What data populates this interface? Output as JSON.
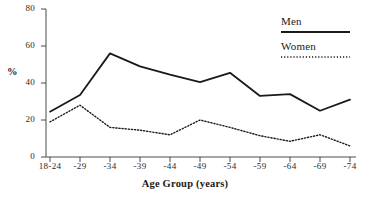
{
  "chart_data": {
    "type": "line",
    "title": "",
    "xlabel": "Age Group (years)",
    "ylabel": "%",
    "categories": [
      "18-24",
      "-29",
      "-34",
      "-39",
      "-44",
      "-49",
      "-54",
      "-59",
      "-64",
      "-69",
      "-74"
    ],
    "series": [
      {
        "name": "Men",
        "style": "solid",
        "color": "#1a1a1a",
        "values": [
          24.5,
          33.5,
          56.0,
          49.0,
          44.5,
          40.5,
          45.5,
          33.0,
          34.0,
          25.0,
          31.0
        ]
      },
      {
        "name": "Women",
        "style": "dotted",
        "color": "#1a1a1a",
        "values": [
          19.0,
          28.0,
          16.0,
          14.5,
          12.0,
          20.0,
          16.0,
          11.5,
          8.5,
          12.0,
          6.0
        ]
      }
    ],
    "ylim": [
      0,
      80
    ],
    "yticks": [
      0,
      20,
      40,
      60,
      80
    ],
    "ytick_labels": [
      "0",
      "20",
      "40",
      "60",
      "80"
    ],
    "grid": false,
    "legend_position": "top-right",
    "legend_entries": [
      "Men",
      "Women"
    ]
  },
  "axes": {
    "y_title": "%",
    "x_title": "Age Group (years)"
  },
  "legend": {
    "men_label": "Men",
    "women_label": "Women"
  }
}
